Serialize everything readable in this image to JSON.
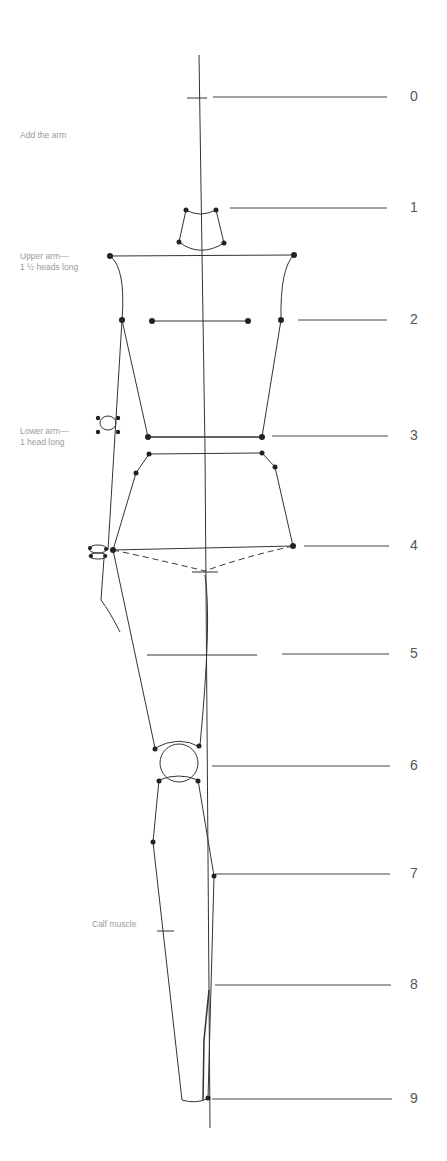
{
  "annotations": [
    {
      "id": "add-arm",
      "text": "Add the arm",
      "x": 20,
      "y": 136
    },
    {
      "id": "upper-arm",
      "text": "Upper arm—\n1 ½ heads long",
      "x": 20,
      "y": 257
    },
    {
      "id": "lower-arm",
      "text": "Lower arm—\n1 head long",
      "x": 20,
      "y": 432
    },
    {
      "id": "calf-muscle",
      "text": "Calf muscle",
      "x": 92,
      "y": 925
    }
  ],
  "head_units": [
    {
      "label": "0",
      "y": 97,
      "x1": 213,
      "x2": 387
    },
    {
      "label": "1",
      "y": 208,
      "x1": 230,
      "x2": 387
    },
    {
      "label": "2",
      "y": 320,
      "x1": 298,
      "x2": 387
    },
    {
      "label": "3",
      "y": 436,
      "x1": 272,
      "x2": 388
    },
    {
      "label": "4",
      "y": 546,
      "x1": 304,
      "x2": 389
    },
    {
      "label": "5",
      "y": 654,
      "x1": 282,
      "x2": 389
    },
    {
      "label": "6",
      "y": 766,
      "x1": 212,
      "x2": 390
    },
    {
      "label": "7",
      "y": 874,
      "x1": 215,
      "x2": 390
    },
    {
      "label": "8",
      "y": 985,
      "x1": 215,
      "x2": 391
    },
    {
      "label": "9",
      "y": 1099,
      "x1": 212,
      "x2": 392
    }
  ],
  "colors": {
    "line": "#333333",
    "label": "#555555",
    "annotation": "#9a9a9a"
  }
}
